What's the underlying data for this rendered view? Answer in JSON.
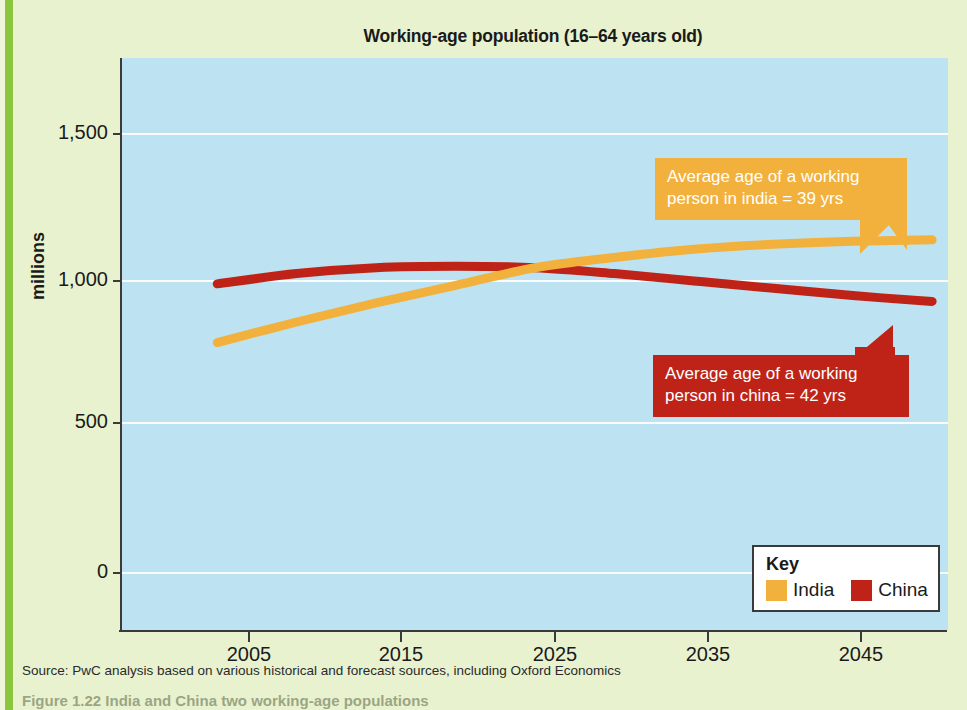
{
  "chart_data": {
    "type": "line",
    "title": "Working-age population (16–64 years old)",
    "xlabel": "",
    "ylabel": "millions",
    "xlim": [
      1999,
      2051
    ],
    "ylim": [
      -250,
      1700
    ],
    "xticks": [
      2005,
      2015,
      2025,
      2035,
      2045
    ],
    "yticks": [
      0,
      500,
      1000,
      1500
    ],
    "ytick_labels": [
      "0",
      "500",
      "1,000",
      "1,500"
    ],
    "grid": true,
    "legend_position": "bottom-right",
    "x": [
      2005,
      2010,
      2015,
      2020,
      2025,
      2030,
      2035,
      2040,
      2045,
      2050
    ],
    "series": [
      {
        "name": "India",
        "color": "#f2b13c",
        "values": [
          730,
          800,
          865,
          925,
          985,
          1020,
          1048,
          1065,
          1075,
          1080
        ]
      },
      {
        "name": "China",
        "color": "#bf2317",
        "values": [
          930,
          965,
          985,
          990,
          985,
          965,
          940,
          915,
          890,
          870
        ]
      }
    ],
    "annotations": [
      {
        "id": "india-callout",
        "series": "India",
        "line1": "Average age of a working",
        "line2": "person in india = 39 yrs",
        "value_years": 39,
        "color": "#f2b13c",
        "text_color": "#ffffff"
      },
      {
        "id": "china-callout",
        "series": "China",
        "line1": "Average age of a working",
        "line2": "person in china = 42 yrs",
        "value_years": 42,
        "color": "#bf2317",
        "text_color": "#ffffff"
      }
    ],
    "plot_background": "#bde3f2",
    "page_background": "#e9f2cf"
  },
  "legend": {
    "title": "Key",
    "items": [
      {
        "label": "India",
        "color": "#f2b13c"
      },
      {
        "label": "China",
        "color": "#bf2317"
      }
    ]
  },
  "source": {
    "text": "Source: PwC analysis based on various historical and forecast sources, including Oxford Economics"
  },
  "caption": {
    "text": "Figure 1.22 India and China two working-age populations"
  }
}
